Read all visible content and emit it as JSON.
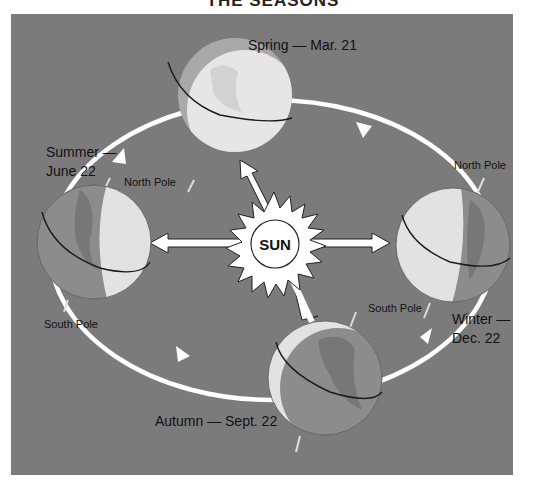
{
  "title": "THE SEASONS",
  "colors": {
    "background": "#7b7b7b",
    "orbit": "#ffffff",
    "lit": "#e4e4e4",
    "dark": "#8e8e8e",
    "land_dark": "#6f6f6f",
    "equator": "#1a1a1a"
  },
  "sun": {
    "label": "SUN"
  },
  "seasons": [
    {
      "id": "spring",
      "label": "Spring — Mar. 21"
    },
    {
      "id": "summer",
      "label_line1": "Summer —",
      "label_line2": "June 22",
      "north_pole": "North Pole",
      "south_pole": "South Pole"
    },
    {
      "id": "winter",
      "label_line1": "Winter —",
      "label_line2": "Dec. 22",
      "north_pole": "North Pole",
      "south_pole": "South Pole"
    },
    {
      "id": "autumn",
      "label": "Autumn — Sept. 22"
    }
  ]
}
